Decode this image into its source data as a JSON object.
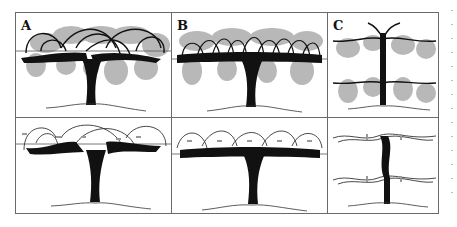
{
  "figure": {
    "panels": [
      {
        "id": "A",
        "label": "A",
        "row": "top",
        "description": "Head-trained vine with long canes arched over a wire, foliage and grape clusters shown in gray"
      },
      {
        "id": "B",
        "label": "B",
        "row": "top",
        "description": "Cordon-trained vine with many short arching shoots over a horizontal wire, gray foliage"
      },
      {
        "id": "C",
        "label": "C",
        "row": "top",
        "description": "Two-tier vertical trunk with horizontal arms at two levels, gray grape clusters"
      },
      {
        "id": "A-pruned",
        "label": "",
        "row": "bottom",
        "description": "Head-trained vine after pruning with canes tied to wire"
      },
      {
        "id": "B-pruned",
        "label": "",
        "row": "bottom",
        "description": "Cordon vine after pruning with spurs along wire"
      },
      {
        "id": "C-pruned",
        "label": "",
        "row": "bottom",
        "description": "Two-tier vine after pruning with canes wrapped on two wires"
      }
    ],
    "colors": {
      "line": "#111111",
      "foliage": "#b8b8b8",
      "border": "#6a6a6a",
      "ties": "#999999"
    }
  }
}
